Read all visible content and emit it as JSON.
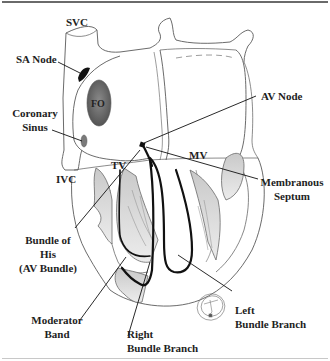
{
  "diagram": {
    "type": "anatomical-illustration",
    "colors": {
      "outline": "#5a5a5a",
      "conduction_path": "#111111",
      "shading": "#9a9a9a",
      "label_text": "#1e1e1e",
      "background": "#ffffff"
    },
    "labels": {
      "svc": "SVC",
      "sa_node": "SA Node",
      "fo": "FO",
      "coronary_sinus_line1": "Coronary",
      "coronary_sinus_line2": "Sinus",
      "ivc": "IVC",
      "tv": "TV",
      "mv": "MV",
      "av_node": "AV Node",
      "membranous_septum_line1": "Membranous",
      "membranous_septum_line2": "Septum",
      "bundle_of_his_line1": "Bundle of",
      "bundle_of_his_line2": "His",
      "bundle_of_his_line3": "(AV Bundle)",
      "moderator_band_line1": "Moderator",
      "moderator_band_line2": "Band",
      "right_bundle_branch_line1": "Right",
      "right_bundle_branch_line2": "Bundle Branch",
      "left_bundle_branch_line1": "Left",
      "left_bundle_branch_line2": "Bundle Branch"
    }
  }
}
